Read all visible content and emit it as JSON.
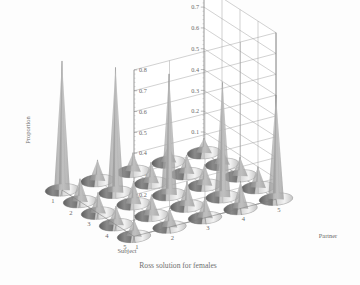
{
  "caption": "Ross solution for females",
  "chart_data": {
    "type": "surface3d-cones",
    "title": "Ross solution for females",
    "xlabel": "Subject",
    "ylabel": "Partner",
    "zlabel": "Proportion",
    "x_categories": [
      "1",
      "2",
      "3",
      "4",
      "5"
    ],
    "y_categories": [
      "1",
      "2",
      "3",
      "4",
      "5"
    ],
    "zlim": [
      0,
      0.8
    ],
    "z_ticks": [
      "0",
      "0.1",
      "0.2",
      "0.3",
      "0.4",
      "0.5",
      "0.6",
      "0.7",
      "0.8"
    ],
    "z_tick_values": [
      0,
      0.1,
      0.2,
      0.3,
      0.4,
      0.5,
      0.6,
      0.7,
      0.8
    ],
    "grid": true,
    "legend": "none",
    "left_axis_ticks": [
      "0.8",
      "0.7",
      "0.6",
      "0.5",
      "0.4",
      "0.3",
      "0.2",
      "0.1",
      "0"
    ],
    "right_axis_ticks": [
      "0.8",
      "0.7",
      "0.6",
      "0.5",
      "0.4",
      "0.3",
      "0.2",
      "0.1",
      "0"
    ],
    "marker_shape": "cone",
    "matrix": [
      [
        0.62,
        0.1,
        0.09,
        0.08,
        0.07
      ],
      [
        0.11,
        0.6,
        0.1,
        0.09,
        0.08
      ],
      [
        0.1,
        0.11,
        0.58,
        0.1,
        0.09
      ],
      [
        0.09,
        0.1,
        0.12,
        0.55,
        0.1
      ],
      [
        0.08,
        0.09,
        0.1,
        0.13,
        0.5
      ]
    ],
    "points": [
      {
        "subject": 1,
        "partner": 1,
        "value": 0.62
      },
      {
        "subject": 1,
        "partner": 2,
        "value": 0.1
      },
      {
        "subject": 1,
        "partner": 3,
        "value": 0.09
      },
      {
        "subject": 1,
        "partner": 4,
        "value": 0.08
      },
      {
        "subject": 1,
        "partner": 5,
        "value": 0.07
      },
      {
        "subject": 2,
        "partner": 1,
        "value": 0.11
      },
      {
        "subject": 2,
        "partner": 2,
        "value": 0.6
      },
      {
        "subject": 2,
        "partner": 3,
        "value": 0.1
      },
      {
        "subject": 2,
        "partner": 4,
        "value": 0.09
      },
      {
        "subject": 2,
        "partner": 5,
        "value": 0.08
      },
      {
        "subject": 3,
        "partner": 1,
        "value": 0.1
      },
      {
        "subject": 3,
        "partner": 2,
        "value": 0.11
      },
      {
        "subject": 3,
        "partner": 3,
        "value": 0.58
      },
      {
        "subject": 3,
        "partner": 4,
        "value": 0.1
      },
      {
        "subject": 3,
        "partner": 5,
        "value": 0.09
      },
      {
        "subject": 4,
        "partner": 1,
        "value": 0.09
      },
      {
        "subject": 4,
        "partner": 2,
        "value": 0.1
      },
      {
        "subject": 4,
        "partner": 3,
        "value": 0.12
      },
      {
        "subject": 4,
        "partner": 4,
        "value": 0.55
      },
      {
        "subject": 4,
        "partner": 5,
        "value": 0.1
      },
      {
        "subject": 5,
        "partner": 1,
        "value": 0.08
      },
      {
        "subject": 5,
        "partner": 2,
        "value": 0.09
      },
      {
        "subject": 5,
        "partner": 3,
        "value": 0.1
      },
      {
        "subject": 5,
        "partner": 4,
        "value": 0.13
      },
      {
        "subject": 5,
        "partner": 5,
        "value": 0.5
      }
    ]
  },
  "colors": {
    "background": "#fdfdfd",
    "grid": "#9b9b9b",
    "axis": "#7d7d7d",
    "text": "#6a6a6a",
    "cone_light": "#e8e8e8",
    "cone_mid": "#b6b6b6",
    "cone_dark": "#7a7a7a"
  }
}
